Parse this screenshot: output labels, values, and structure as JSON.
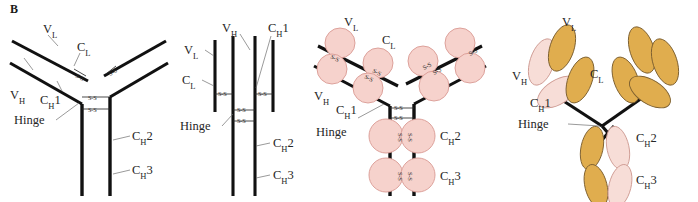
{
  "figure": {
    "panel_letter": "B",
    "background_color": "#ffffff",
    "line_color": "#111111",
    "caption_absent": true
  },
  "labels": {
    "vl": "V",
    "vl_sub": "L",
    "cl": "C",
    "cl_sub": "L",
    "vh": "V",
    "vh_sub": "H",
    "ch1": "C",
    "ch1_sub": "H",
    "ch1_num": "1",
    "ch2": "C",
    "ch2_sub": "H",
    "ch2_num": "2",
    "ch3": "C",
    "ch3_sub": "H",
    "ch3_num": "3",
    "hinge": "Hinge",
    "disulfide": "S-S"
  },
  "panels": [
    {
      "id": "panel-a",
      "name": "line-diagram-y-shape",
      "description": "Y-shaped antibody drawn as plain heavy black lines with S-S interchain disulfide bonds",
      "style": "line",
      "labels_shown": [
        "V_L",
        "C_L",
        "V_H",
        "C_H1",
        "Hinge",
        "C_H2",
        "C_H3"
      ],
      "disulfide_count": 6
    },
    {
      "id": "panel-b",
      "name": "linear-chain-diagram",
      "description": "Four parallel vertical chains: two outer light chains and two inner heavy chains joined by S-S bonds",
      "style": "linear",
      "labels_shown": [
        "V_L",
        "C_L",
        "V_H",
        "C_H1",
        "Hinge",
        "C_H2",
        "C_H3"
      ],
      "disulfide_count": 4
    },
    {
      "id": "panel-c",
      "name": "domain-circles-diagram",
      "description": "Y-shaped antibody with each immunoglobulin domain drawn as a pink circle along the chain backbone",
      "style": "circles",
      "domain_fill": "#f6d2cc",
      "domain_stroke": "#d99a93",
      "labels_shown": [
        "V_L",
        "C_L",
        "V_H",
        "C_H1",
        "Hinge",
        "C_H2",
        "C_H3"
      ],
      "domain_count": 12
    },
    {
      "id": "panel-d",
      "name": "domain-ellipses-ribbon-diagram",
      "description": "Y-shaped antibody with domains as tilted ellipses; light chain domains gold, heavy chain domains pink",
      "style": "ellipses",
      "light_chain_color": "#e0ad4e",
      "heavy_chain_color": "#f7ddd7",
      "labels_shown": [
        "V_L",
        "C_L",
        "V_H",
        "C_H1",
        "Hinge",
        "C_H2",
        "C_H3"
      ],
      "domain_count": 12
    }
  ]
}
